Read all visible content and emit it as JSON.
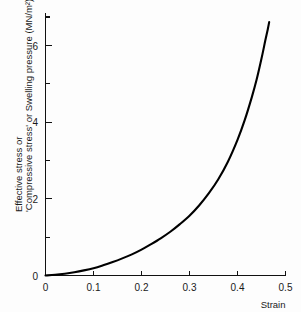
{
  "chart_data": {
    "type": "line",
    "title": "",
    "subtitle": "",
    "xlabel": "Strain",
    "ylabel": "Effective stress or 'Compressive stress' or Swelling pressure (MN/m²)",
    "ylabel_line1": "Effective stress or",
    "ylabel_line2": "'Compressive stress' or Swelling pressure (MN/m²)",
    "xlim": [
      0,
      0.5
    ],
    "ylim": [
      0,
      7.2
    ],
    "grid": false,
    "legend": false,
    "legend_position": "none",
    "x_ticks": [
      0,
      0.1,
      0.2,
      0.3,
      0.4,
      0.5
    ],
    "x_tick_labels": [
      "0",
      "0.1",
      "0.2",
      "0.3",
      "0.4",
      "0.5"
    ],
    "y_ticks": [
      0,
      1,
      2,
      3,
      4,
      5,
      6,
      7
    ],
    "y_tick_labels": [
      "0",
      "",
      "2",
      "",
      "4",
      "",
      "6",
      ""
    ],
    "y_major_ticks": [
      0,
      2,
      4,
      6
    ],
    "y_minor_ticks": [
      1,
      3,
      5,
      7
    ],
    "series": [
      {
        "name": "Effective stress vs strain",
        "color": "#000000",
        "x": [
          0.0,
          0.02,
          0.04,
          0.06,
          0.08,
          0.1,
          0.12,
          0.14,
          0.16,
          0.18,
          0.2,
          0.22,
          0.24,
          0.26,
          0.28,
          0.3,
          0.32,
          0.34,
          0.36,
          0.38,
          0.4,
          0.415,
          0.43,
          0.44,
          0.45,
          0.458,
          0.463,
          0.466
        ],
        "y": [
          0.0,
          0.02,
          0.05,
          0.09,
          0.14,
          0.2,
          0.28,
          0.37,
          0.47,
          0.58,
          0.71,
          0.86,
          1.02,
          1.2,
          1.41,
          1.64,
          1.92,
          2.25,
          2.64,
          3.12,
          3.72,
          4.26,
          4.9,
          5.38,
          5.95,
          6.45,
          6.75,
          6.95
        ]
      }
    ]
  },
  "axes": {
    "x_axis_name": "strain-axis",
    "y_axis_name": "stress-axis"
  }
}
